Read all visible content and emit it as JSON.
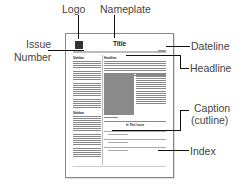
{
  "labels": {
    "logo": "Logo",
    "nameplate": "Nameplate",
    "issue_number_line1": "Issue",
    "issue_number_line2": "Number",
    "dateline": "Dateline",
    "headline": "Headline",
    "caption_line1": "Caption",
    "caption_line2": "(cutline)",
    "index": "Index"
  },
  "page": {
    "title": "Title",
    "sidebar_heading_1": "Sidebar",
    "sidebar_heading_2": "Sidebar",
    "headline": "Headline",
    "index_title": "In This Issue"
  },
  "colors": {
    "leader_lines": "#111111",
    "label_text": "#444444",
    "photo": "#8a8a8a"
  }
}
